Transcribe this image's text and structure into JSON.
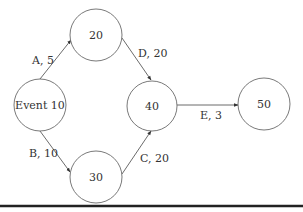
{
  "diagram": {
    "type": "activity-on-arrow network",
    "nodes": [
      {
        "id": "event10",
        "label": "Event 10",
        "cx": 40,
        "cy": 105,
        "r": 26
      },
      {
        "id": "n20",
        "label": "20",
        "cx": 96,
        "cy": 35,
        "r": 26
      },
      {
        "id": "n30",
        "label": "30",
        "cx": 96,
        "cy": 177,
        "r": 26
      },
      {
        "id": "n40",
        "label": "40",
        "cx": 152,
        "cy": 106,
        "r": 25
      },
      {
        "id": "n50",
        "label": "50",
        "cx": 264,
        "cy": 104,
        "r": 26
      }
    ],
    "edges": [
      {
        "id": "A",
        "label": "A, 5",
        "from": "event10",
        "to": "n20"
      },
      {
        "id": "B",
        "label": "B, 10",
        "from": "event10",
        "to": "n30"
      },
      {
        "id": "D",
        "label": "D, 20",
        "from": "n20",
        "to": "n40"
      },
      {
        "id": "C",
        "label": "C, 20",
        "from": "n30",
        "to": "n40"
      },
      {
        "id": "E",
        "label": "E, 3",
        "from": "n40",
        "to": "n50"
      }
    ]
  },
  "colors": {
    "node_stroke": "#6a6a6a",
    "edge_stroke": "#5a5a5a",
    "text": "#333333",
    "rule": "#222222"
  }
}
